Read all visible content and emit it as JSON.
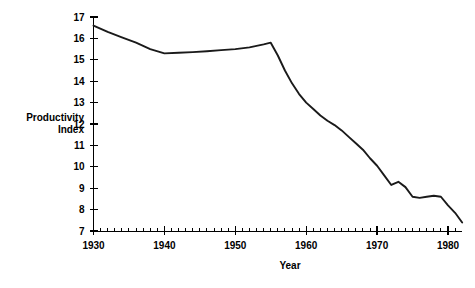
{
  "chart_data": {
    "type": "line",
    "title": "",
    "xlabel": "Year",
    "ylabel": "Productivity Index",
    "xlim": [
      1930,
      1982
    ],
    "ylim": [
      7,
      17
    ],
    "grid": false,
    "legend": "none",
    "x_major_ticks": [
      1930,
      1940,
      1950,
      1960,
      1970,
      1980
    ],
    "x_minor_tick_step": 1,
    "y_major_ticks": [
      7,
      8,
      9,
      10,
      11,
      12,
      13,
      14,
      15,
      16,
      17
    ],
    "x_tick_labels": [
      "1930",
      "1940",
      "1950",
      "1960",
      "1970",
      "1980"
    ],
    "y_tick_labels": [
      "7",
      "8",
      "9",
      "10",
      "11",
      "12",
      "13",
      "14",
      "15",
      "16",
      "17"
    ],
    "line_color": "#1a1a1a",
    "series": [
      {
        "name": "Productivity Index",
        "x": [
          1930,
          1932,
          1934,
          1936,
          1938,
          1940,
          1942,
          1944,
          1946,
          1948,
          1950,
          1952,
          1954,
          1955,
          1956,
          1957,
          1958,
          1959,
          1960,
          1961,
          1962,
          1963,
          1964,
          1965,
          1966,
          1967,
          1968,
          1969,
          1970,
          1971,
          1972,
          1973,
          1974,
          1975,
          1976,
          1977,
          1978,
          1979,
          1980,
          1981,
          1982
        ],
        "y": [
          16.6,
          16.3,
          16.05,
          15.8,
          15.5,
          15.3,
          15.33,
          15.36,
          15.4,
          15.45,
          15.5,
          15.58,
          15.72,
          15.8,
          15.2,
          14.5,
          13.9,
          13.4,
          13.0,
          12.7,
          12.4,
          12.15,
          11.95,
          11.7,
          11.4,
          11.1,
          10.8,
          10.4,
          10.05,
          9.6,
          9.15,
          9.3,
          9.05,
          8.6,
          8.55,
          8.6,
          8.65,
          8.6,
          8.2,
          7.85,
          7.4
        ]
      }
    ],
    "ylabel_line1": "Productivity",
    "ylabel_line2": "Index"
  },
  "axes": {
    "y_axis_name": "y-axis",
    "x_axis_name": "x-axis"
  }
}
